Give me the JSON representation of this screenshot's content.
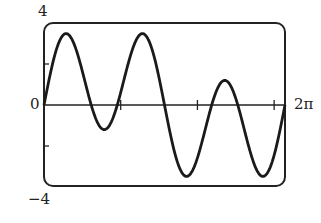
{
  "chart_data": {
    "type": "line",
    "title": "",
    "xlabel": "",
    "ylabel": "",
    "xlim": [
      0,
      6.2832
    ],
    "ylim": [
      -4,
      4
    ],
    "x_tick_labels": [
      "0",
      "2π"
    ],
    "y_tick_labels": [
      "4",
      "0",
      "−4"
    ],
    "x_ticks": [
      2,
      4,
      6
    ],
    "y_ticks": [
      2,
      -2
    ],
    "grid": false,
    "series": [
      {
        "name": "f(x)",
        "function_approx": "2.7*sin(3x) + 1.5*sin(x)",
        "key_points": [
          {
            "x": 0,
            "y": 0
          },
          {
            "x": 0.52,
            "y": 3.7
          },
          {
            "x": 1.57,
            "y": -1.2
          },
          {
            "x": 2.62,
            "y": 3.7
          },
          {
            "x": 3.67,
            "y": -3.6
          },
          {
            "x": 4.71,
            "y": 2.0
          },
          {
            "x": 5.76,
            "y": -3.6
          },
          {
            "x": 6.28,
            "y": 0
          }
        ]
      }
    ],
    "color": "#1a1a1a"
  },
  "labels": {
    "y_top": "4",
    "y_zero": "0",
    "y_bottom": "−4",
    "x_end": "2π"
  }
}
